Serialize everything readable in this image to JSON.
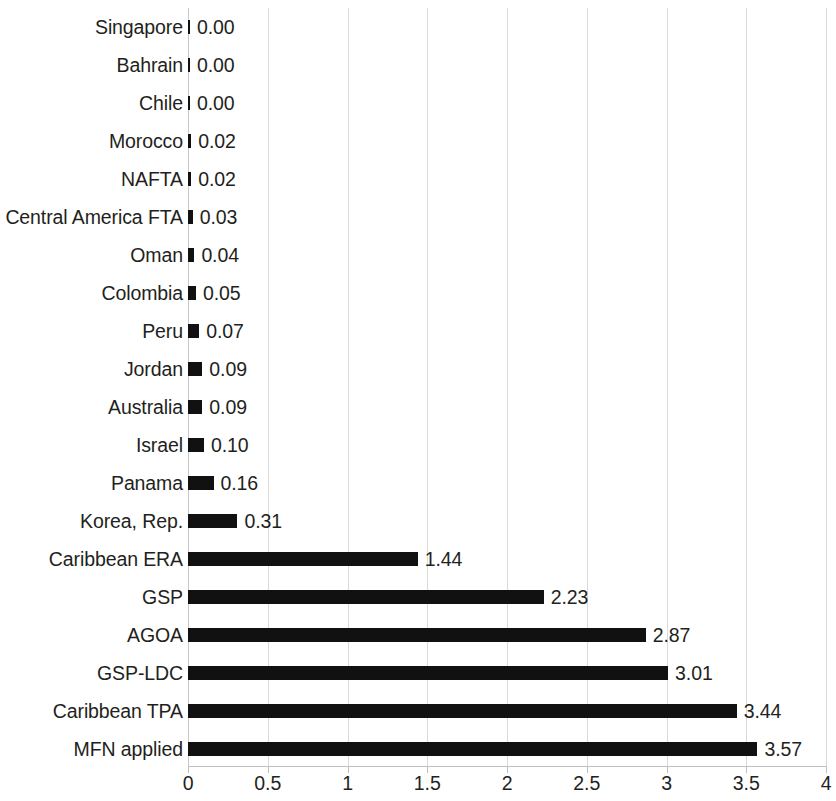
{
  "chart_data": {
    "type": "bar",
    "orientation": "horizontal",
    "title": "",
    "subtitle": "",
    "xlabel": "",
    "ylabel": "",
    "xlim": [
      0,
      4
    ],
    "ylim": null,
    "grid": true,
    "gridlines_axis": "x",
    "legend": null,
    "legend_position": "none",
    "xticks": [
      "0",
      "0.5",
      "1",
      "1.5",
      "2",
      "2.5",
      "3",
      "3.5",
      "4"
    ],
    "xtick_values": [
      0,
      0.5,
      1,
      1.5,
      2,
      2.5,
      3,
      3.5,
      4
    ],
    "bar_color": "#111111",
    "text_color": "#231f20",
    "gridline_color": "#d9d9d9",
    "value_label_format": "0.00",
    "categories": [
      "Singapore",
      "Bahrain",
      "Chile",
      "Morocco",
      "NAFTA",
      "Central America FTA",
      "Oman",
      "Colombia",
      "Peru",
      "Jordan",
      "Australia",
      "Israel",
      "Panama",
      "Korea, Rep.",
      "Caribbean ERA",
      "GSP",
      "AGOA",
      "GSP-LDC",
      "Caribbean TPA",
      "MFN applied"
    ],
    "values": [
      0.0,
      0.0,
      0.0,
      0.02,
      0.02,
      0.03,
      0.04,
      0.05,
      0.07,
      0.09,
      0.09,
      0.1,
      0.16,
      0.31,
      1.44,
      2.23,
      2.87,
      3.01,
      3.44,
      3.57
    ],
    "value_labels": [
      "0.00",
      "0.00",
      "0.00",
      "0.02",
      "0.02",
      "0.03",
      "0.04",
      "0.05",
      "0.07",
      "0.09",
      "0.09",
      "0.10",
      "0.16",
      "0.31",
      "1.44",
      "2.23",
      "2.87",
      "3.01",
      "3.44",
      "3.57"
    ]
  }
}
